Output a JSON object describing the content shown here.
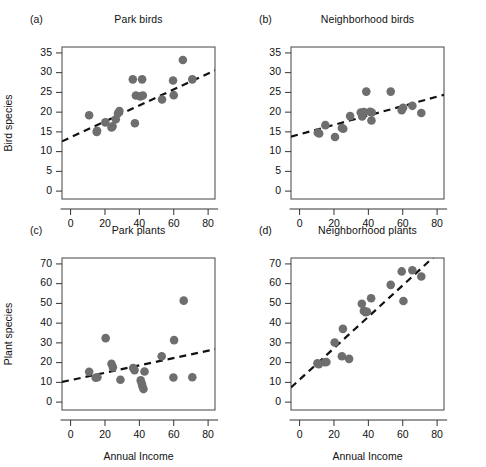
{
  "figure": {
    "point_color": "#6e6e6e",
    "trendline_color": "#111111",
    "frame_color": "#555555",
    "background": "#ffffff"
  },
  "chart_data": [
    {
      "id": "a",
      "type": "scatter",
      "tag": "(a)",
      "title": "Park birds",
      "xlabel": "",
      "ylabel": "Bird species",
      "xlim": [
        -5,
        84
      ],
      "ylim": [
        -2,
        36.5
      ],
      "xticks": [
        0,
        20,
        40,
        60,
        80
      ],
      "yticks": [
        0,
        5,
        10,
        15,
        20,
        25,
        30,
        35
      ],
      "grid": false,
      "legend": "none",
      "x": [
        10.8,
        15.2,
        15.4,
        20.2,
        23.8,
        24.4,
        26.3,
        27.6,
        28.4,
        36.2,
        37.4,
        38.0,
        40.6,
        41.6,
        42.0,
        53.2,
        59.6,
        60.0,
        65.3,
        70.8
      ],
      "y": [
        19.2,
        15.0,
        15.3,
        17.4,
        16.1,
        16.4,
        18.2,
        19.7,
        20.3,
        28.3,
        17.2,
        24.2,
        24.0,
        28.3,
        24.2,
        23.2,
        28.0,
        24.3,
        33.2,
        28.3
      ],
      "trendline": {
        "x": [
          -5,
          84
        ],
        "y": [
          12.6,
          30.6
        ]
      }
    },
    {
      "id": "b",
      "type": "scatter",
      "tag": "(b)",
      "title": "Neighborhood birds",
      "xlabel": "",
      "ylabel": "",
      "xlim": [
        -5,
        84
      ],
      "ylim": [
        -2,
        36.5
      ],
      "xticks": [
        0,
        20,
        40,
        60,
        80
      ],
      "yticks": [
        0,
        5,
        10,
        15,
        20,
        25,
        30,
        35
      ],
      "grid": false,
      "legend": "none",
      "x": [
        10.6,
        11.4,
        15.0,
        20.6,
        24.6,
        25.4,
        29.4,
        35.6,
        36.4,
        37.4,
        38.8,
        41.0,
        41.8,
        42.0,
        53.0,
        59.4,
        60.2,
        65.6,
        70.8
      ],
      "y": [
        14.8,
        14.6,
        16.7,
        13.7,
        16.0,
        15.8,
        19.0,
        19.9,
        18.9,
        20.0,
        25.2,
        20.1,
        17.9,
        19.9,
        25.2,
        20.5,
        21.1,
        21.6,
        19.8
      ],
      "trendline": {
        "x": [
          -5,
          84
        ],
        "y": [
          13.8,
          24.4
        ]
      }
    },
    {
      "id": "c",
      "type": "scatter",
      "tag": "(c)",
      "title": "Park plants",
      "xlabel": "Annual Income",
      "ylabel": "Plant species",
      "xlim": [
        -5,
        84
      ],
      "ylim": [
        -4,
        73
      ],
      "xticks": [
        0,
        20,
        40,
        60,
        80
      ],
      "yticks": [
        0,
        10,
        20,
        30,
        40,
        50,
        60,
        70
      ],
      "grid": false,
      "legend": "none",
      "x": [
        10.8,
        14.6,
        15.6,
        20.4,
        23.8,
        24.6,
        29.0,
        36.4,
        37.2,
        40.8,
        41.4,
        41.8,
        42.4,
        43.0,
        53.0,
        59.8,
        60.2,
        65.8,
        70.8
      ],
      "y": [
        15.4,
        12.3,
        12.6,
        32.4,
        19.4,
        17.6,
        11.3,
        17.3,
        16.2,
        11.0,
        9.4,
        8.0,
        6.6,
        15.5,
        23.2,
        12.5,
        31.4,
        51.4,
        12.6
      ],
      "trendline": {
        "x": [
          -5,
          84
        ],
        "y": [
          10.2,
          26.8
        ]
      }
    },
    {
      "id": "d",
      "type": "scatter",
      "tag": "(d)",
      "title": "Neighborhood plants",
      "xlabel": "Annual Income",
      "ylabel": "",
      "xlim": [
        -5,
        84
      ],
      "ylim": [
        -4,
        73
      ],
      "xticks": [
        0,
        20,
        40,
        60,
        80
      ],
      "yticks": [
        0,
        10,
        20,
        30,
        40,
        50,
        60,
        70
      ],
      "grid": false,
      "legend": "none",
      "x": [
        10.4,
        11.2,
        14.8,
        15.6,
        20.4,
        24.6,
        25.2,
        28.8,
        36.2,
        37.4,
        38.4,
        39.2,
        41.6,
        53.0,
        59.4,
        60.4,
        65.6,
        70.8
      ],
      "y": [
        19.6,
        19.2,
        20.2,
        20.3,
        30.2,
        23.2,
        37.1,
        21.9,
        49.8,
        46.2,
        45.6,
        45.8,
        52.6,
        59.4,
        66.2,
        51.2,
        66.8,
        63.6
      ],
      "trendline": {
        "x": [
          -5,
          78
        ],
        "y": [
          7.4,
          73.5
        ]
      }
    }
  ]
}
